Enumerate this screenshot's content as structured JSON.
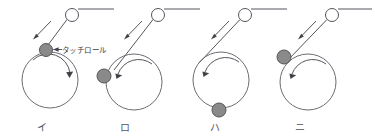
{
  "figure": {
    "background_color": "#ffffff",
    "line_color": "#54565c",
    "touch_roll_color": "#8a8a8a",
    "winder_color": "#6a6c72",
    "callout": {
      "label": "タッチロール",
      "points_to": "touch-roll-panel-1"
    },
    "panels": [
      {
        "id": "panel-1",
        "label": "イ",
        "label_x": 42,
        "label_y": 130,
        "guide_roll": {
          "cx": 72,
          "cy": 15,
          "r": 6.5
        },
        "web_top_line": {
          "x1": 78,
          "y1": 9,
          "x2": 114,
          "y2": 9
        },
        "web_path": {
          "x1": 66,
          "y1": 20,
          "x2": 45,
          "y2": 49
        },
        "web_arrow": {
          "x1": 49,
          "y1": 22,
          "x2": 33,
          "y2": 39,
          "dir": "down-left"
        },
        "winder": {
          "cx": 50,
          "cy": 80,
          "r": 28
        },
        "touch_roll": {
          "cx": 46,
          "cy": 50,
          "r": 6.5,
          "position": "top"
        },
        "rotation": {
          "direction": "clockwise",
          "arrow_at": "right"
        }
      },
      {
        "id": "panel-2",
        "label": "ロ",
        "label_x": 125,
        "label_y": 130,
        "guide_roll": {
          "cx": 158,
          "cy": 15,
          "r": 6.5
        },
        "web_top_line": {
          "x1": 164,
          "y1": 9,
          "x2": 200,
          "y2": 9
        },
        "web_path": {
          "x1": 152,
          "y1": 20,
          "x2": 115,
          "y2": 68
        },
        "web_arrow": {
          "x1": 140,
          "y1": 22,
          "x2": 124,
          "y2": 40,
          "dir": "down-left"
        },
        "winder": {
          "cx": 134,
          "cy": 82,
          "r": 28
        },
        "touch_roll": {
          "cx": 104,
          "cy": 76,
          "r": 7,
          "position": "left"
        },
        "rotation": {
          "direction": "counterclockwise",
          "arrow_at": "left"
        }
      },
      {
        "id": "panel-3",
        "label": "ハ",
        "label_x": 215,
        "label_y": 130,
        "guide_roll": {
          "cx": 245,
          "cy": 15,
          "r": 6.5
        },
        "web_top_line": {
          "x1": 251,
          "y1": 9,
          "x2": 287,
          "y2": 9
        },
        "web_path": {
          "x1": 239,
          "y1": 20,
          "x2": 200,
          "y2": 62
        },
        "web_arrow": {
          "x1": 227,
          "y1": 22,
          "x2": 211,
          "y2": 39,
          "dir": "down-left"
        },
        "winder": {
          "cx": 221,
          "cy": 80,
          "r": 28
        },
        "touch_roll": {
          "cx": 219,
          "cy": 110,
          "r": 7,
          "position": "bottom"
        },
        "rotation": {
          "direction": "counterclockwise",
          "arrow_at": "left"
        }
      },
      {
        "id": "panel-4",
        "label": "ニ",
        "label_x": 300,
        "label_y": 130,
        "guide_roll": {
          "cx": 332,
          "cy": 15,
          "r": 6.5
        },
        "web_top_line": {
          "x1": 338,
          "y1": 9,
          "x2": 372,
          "y2": 9
        },
        "web_path": {
          "x1": 326,
          "y1": 20,
          "x2": 288,
          "y2": 60
        },
        "web_arrow": {
          "x1": 314,
          "y1": 22,
          "x2": 298,
          "y2": 39,
          "dir": "down-left"
        },
        "winder": {
          "cx": 308,
          "cy": 82,
          "r": 28
        },
        "touch_roll": {
          "cx": 284,
          "cy": 57,
          "r": 7,
          "position": "upper-left"
        },
        "rotation": {
          "direction": "counterclockwise",
          "arrow_at": "left"
        }
      }
    ]
  }
}
